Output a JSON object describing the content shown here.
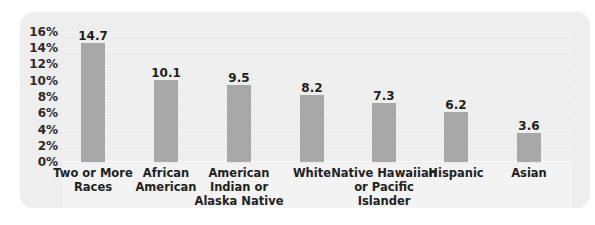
{
  "chart_data": {
    "type": "bar",
    "title": "",
    "xlabel": "",
    "ylabel": "",
    "categories": [
      "Two or More Races",
      "African American",
      "American Indian or Alaska Native",
      "White",
      "Native Hawaiian or Pacific Islander",
      "Hispanic",
      "Asian"
    ],
    "category_labels_display": [
      "Two or More\nRaces",
      "African\nAmerican",
      "American\nIndian or\nAlaska Native",
      "White",
      "Native Hawaiian\nor Pacific Islander",
      "Hispanic",
      "Asian"
    ],
    "values": [
      14.7,
      10.1,
      9.5,
      8.2,
      7.3,
      6.2,
      3.6
    ],
    "value_labels": [
      "14.7",
      "10.1",
      "9.5",
      "8.2",
      "7.3",
      "6.2",
      "3.6"
    ],
    "ylim": [
      0,
      16
    ],
    "yticks": [
      0,
      2,
      4,
      6,
      8,
      10,
      12,
      14,
      16
    ],
    "ytick_labels": [
      "0%",
      "2%",
      "4%",
      "6%",
      "8%",
      "10%",
      "12%",
      "14%",
      "16%"
    ],
    "grid": true,
    "legend": null,
    "colors": {
      "bar": "#a8a8a8",
      "panel": "#eeeeee",
      "gridline": "#ffffff"
    }
  },
  "yaxis": {
    "ticks": [
      "16%",
      "14%",
      "12%",
      "10%",
      "8%",
      "6%",
      "4%",
      "2%",
      "0%"
    ]
  },
  "bars": [
    {
      "value": "14.7",
      "label": "Two or More\nRaces"
    },
    {
      "value": "10.1",
      "label": "African\nAmerican"
    },
    {
      "value": "9.5",
      "label": "American\nIndian or\nAlaska Native"
    },
    {
      "value": "8.2",
      "label": "White"
    },
    {
      "value": "7.3",
      "label": "Native Hawaiian\nor Pacific Islander"
    },
    {
      "value": "6.2",
      "label": "Hispanic"
    },
    {
      "value": "3.6",
      "label": "Asian"
    }
  ]
}
